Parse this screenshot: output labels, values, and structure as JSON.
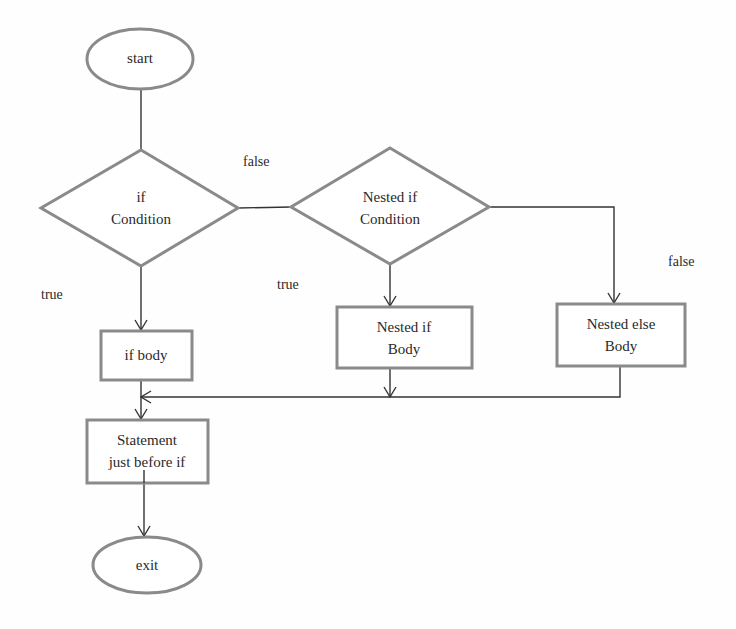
{
  "diagram": {
    "type": "flowchart",
    "title": "",
    "nodes": {
      "start": {
        "label": "start",
        "shape": "ellipse"
      },
      "if_condition": {
        "line1": "if",
        "line2": "Condition",
        "shape": "diamond"
      },
      "nested_if_condition": {
        "line1": "Nested if",
        "line2": "Condition",
        "shape": "diamond"
      },
      "if_body": {
        "label": "if body",
        "shape": "rectangle"
      },
      "nested_if_body": {
        "line1": "Nested if",
        "line2": "Body",
        "shape": "rectangle"
      },
      "nested_else_body": {
        "line1": "Nested else",
        "line2": "Body",
        "shape": "rectangle"
      },
      "statement": {
        "line1": "Statement",
        "line2": "just before if",
        "shape": "rectangle"
      },
      "exit": {
        "label": "exit",
        "shape": "ellipse"
      }
    },
    "edge_labels": {
      "if_false": "false",
      "if_true": "true",
      "nested_true": "true",
      "nested_false": "false"
    },
    "edges": [
      {
        "from": "start",
        "to": "if_condition"
      },
      {
        "from": "if_condition",
        "to": "nested_if_condition",
        "label": "false"
      },
      {
        "from": "if_condition",
        "to": "if_body",
        "label": "true"
      },
      {
        "from": "nested_if_condition",
        "to": "nested_if_body",
        "label": "true"
      },
      {
        "from": "nested_if_condition",
        "to": "nested_else_body",
        "label": "false"
      },
      {
        "from": "nested_if_body",
        "to": "statement"
      },
      {
        "from": "nested_else_body",
        "to": "statement"
      },
      {
        "from": "if_body",
        "to": "statement"
      },
      {
        "from": "statement",
        "to": "exit"
      }
    ],
    "colors": {
      "shape_stroke": "#8a8a8a",
      "line": "#333333",
      "background": "#fefefe"
    }
  }
}
